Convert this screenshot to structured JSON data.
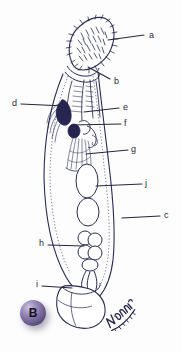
{
  "figure": {
    "panel_letter": "B",
    "caption_signature": "Nisreen",
    "line_color": "#2a2a55",
    "label_color": "#2a2a3c",
    "badge_color": "#7c6a9e",
    "background": "#fdfdfd"
  },
  "labels": [
    {
      "id": "label-a",
      "text": "a",
      "x": 149,
      "y": 31,
      "leader_x1": 108,
      "leader_y1": 40,
      "leader_x2": 144,
      "leader_y2": 35
    },
    {
      "id": "label-b",
      "text": "b",
      "x": 114,
      "y": 77,
      "leader_x1": 88,
      "leader_y1": 67,
      "leader_x2": 110,
      "leader_y2": 79
    },
    {
      "id": "label-d",
      "text": "d",
      "x": 12,
      "y": 99,
      "leader_x1": 21,
      "leader_y1": 104,
      "leader_x2": 65,
      "leader_y2": 106
    },
    {
      "id": "label-e",
      "text": "e",
      "x": 123,
      "y": 103,
      "leader_x1": 84,
      "leader_y1": 112,
      "leader_x2": 119,
      "leader_y2": 108
    },
    {
      "id": "label-f",
      "text": "f",
      "x": 124,
      "y": 119,
      "leader_x1": 72,
      "leader_y1": 125,
      "leader_x2": 121,
      "leader_y2": 124
    },
    {
      "id": "label-g",
      "text": "g",
      "x": 131,
      "y": 145,
      "leader_x1": 86,
      "leader_y1": 154,
      "leader_x2": 128,
      "leader_y2": 150
    },
    {
      "id": "label-j",
      "text": "j",
      "x": 145,
      "y": 179,
      "leader_x1": 96,
      "leader_y1": 186,
      "leader_x2": 142,
      "leader_y2": 184
    },
    {
      "id": "label-c",
      "text": "c",
      "x": 164,
      "y": 211,
      "leader_x1": 122,
      "leader_y1": 218,
      "leader_x2": 160,
      "leader_y2": 216
    },
    {
      "id": "label-h",
      "text": "h",
      "x": 39,
      "y": 239,
      "leader_x1": 48,
      "leader_y1": 245,
      "leader_x2": 84,
      "leader_y2": 246
    },
    {
      "id": "label-i",
      "text": "i",
      "x": 36,
      "y": 280,
      "leader_x1": 42,
      "leader_y1": 286,
      "leader_x2": 72,
      "leader_y2": 288
    }
  ]
}
